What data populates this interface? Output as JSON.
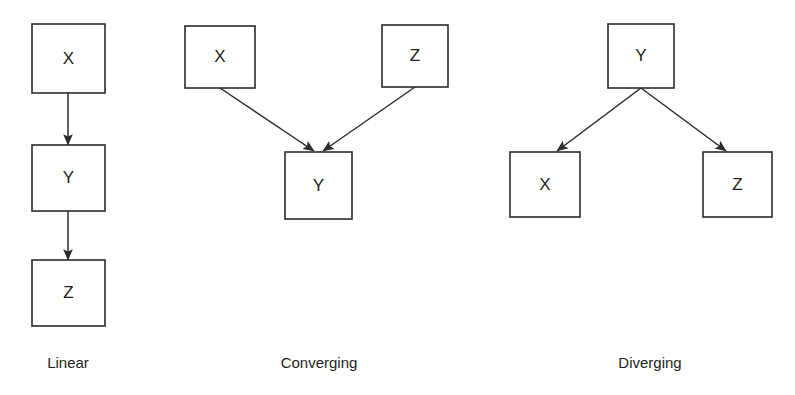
{
  "figure": {
    "background_color": "#ffffff",
    "stroke_color": "#2b2b2b",
    "text_color": "#231f20",
    "box_fill": "#ffffff"
  },
  "panels": [
    {
      "id": "linear",
      "caption": "Linear",
      "caption_x": 68,
      "caption_y": 368,
      "nodes": [
        {
          "label": "X",
          "x": 32,
          "y": 24,
          "w": 73,
          "h": 69
        },
        {
          "label": "Y",
          "x": 32,
          "y": 145,
          "w": 73,
          "h": 66
        },
        {
          "label": "Z",
          "x": 32,
          "y": 260,
          "w": 73,
          "h": 66
        }
      ],
      "edges": [
        {
          "from": "X",
          "to": "Y",
          "x1": 68,
          "y1": 93,
          "x2": 68,
          "y2": 145
        },
        {
          "from": "Y",
          "to": "Z",
          "x1": 68,
          "y1": 211,
          "x2": 68,
          "y2": 260
        }
      ]
    },
    {
      "id": "converging",
      "caption": "Converging",
      "caption_x": 319,
      "caption_y": 368,
      "nodes": [
        {
          "label": "X",
          "x": 185,
          "y": 26,
          "w": 70,
          "h": 62
        },
        {
          "label": "Z",
          "x": 382,
          "y": 25,
          "w": 66,
          "h": 62
        },
        {
          "label": "Y",
          "x": 285,
          "y": 152,
          "w": 67,
          "h": 67
        }
      ],
      "edges": [
        {
          "from": "X",
          "to": "Y",
          "x1": 220,
          "y1": 88,
          "x2": 314,
          "y2": 151
        },
        {
          "from": "Z",
          "to": "Y",
          "x1": 415,
          "y1": 87,
          "x2": 323,
          "y2": 151
        }
      ]
    },
    {
      "id": "diverging",
      "caption": "Diverging",
      "caption_x": 650,
      "caption_y": 368,
      "nodes": [
        {
          "label": "Y",
          "x": 608,
          "y": 24,
          "w": 66,
          "h": 64
        },
        {
          "label": "X",
          "x": 510,
          "y": 152,
          "w": 70,
          "h": 65
        },
        {
          "label": "Z",
          "x": 703,
          "y": 152,
          "w": 69,
          "h": 65
        }
      ],
      "edges": [
        {
          "from": "Y",
          "to": "X",
          "x1": 641,
          "y1": 88,
          "x2": 557,
          "y2": 151
        },
        {
          "from": "Y",
          "to": "Z",
          "x1": 641,
          "y1": 88,
          "x2": 726,
          "y2": 151
        }
      ]
    }
  ]
}
